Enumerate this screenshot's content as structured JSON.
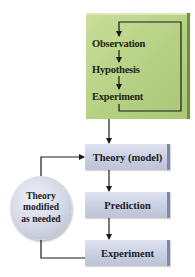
{
  "diagram": {
    "green_panel": {
      "steps": [
        "Observation",
        "Hypothesis",
        "Experiment"
      ],
      "color": "#b5d083",
      "loop": "Experiment feeds back to Observation"
    },
    "main_flow": {
      "steps": [
        "Theory (model)",
        "Prediction",
        "Experiment"
      ],
      "color": "#c8cde0"
    },
    "feedback": {
      "label_lines": [
        "Theory",
        "modified",
        "as needed"
      ],
      "from": "Experiment",
      "to": "Theory (model)"
    },
    "edges": [
      {
        "from": "Observation",
        "to": "Hypothesis"
      },
      {
        "from": "Hypothesis",
        "to": "Experiment"
      },
      {
        "from": "Experiment",
        "to": "Observation",
        "type": "loop"
      },
      {
        "from": "Green panel",
        "to": "Theory (model)"
      },
      {
        "from": "Theory (model)",
        "to": "Prediction"
      },
      {
        "from": "Prediction",
        "to": "Experiment"
      },
      {
        "from": "Experiment",
        "to": "Theory modified as needed"
      },
      {
        "from": "Theory modified as needed",
        "to": "Theory (model)"
      }
    ]
  }
}
